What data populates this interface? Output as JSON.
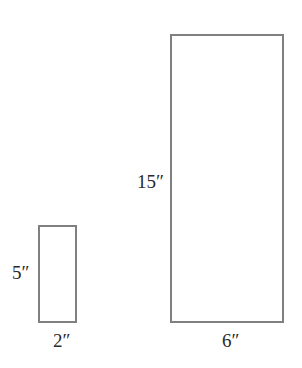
{
  "diagram": {
    "stroke_color": "#808080",
    "text_color": "#2a2a2a",
    "shapes": [
      {
        "name": "small-rectangle",
        "height_label": "5″",
        "width_label": "2″"
      },
      {
        "name": "large-rectangle",
        "height_label": "15″",
        "width_label": "6″"
      }
    ]
  }
}
